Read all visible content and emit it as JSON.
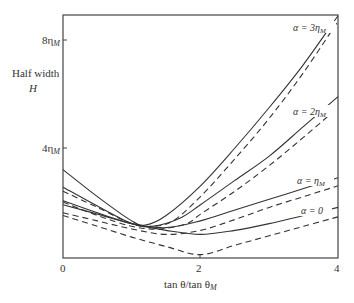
{
  "chart_data": {
    "type": "line",
    "title": "",
    "xlabel": "tan θ/tan θ_M",
    "ylabel": "Half width H",
    "xlim": [
      0,
      4
    ],
    "ylim": [
      0,
      8.9
    ],
    "x_ticks": [
      {
        "value": 0,
        "label": "0"
      },
      {
        "value": 2,
        "label": "2"
      },
      {
        "value": 4,
        "label": "4"
      }
    ],
    "y_ticks": [
      {
        "value": 4,
        "label": "4η_M"
      },
      {
        "value": 8,
        "label": "8η_M"
      }
    ],
    "grid": false,
    "legend": "inline labels near right edge",
    "series": [
      {
        "name": "α = 3η_M",
        "style": "solid",
        "points": [
          [
            0,
            3.2
          ],
          [
            0.5,
            2.2
          ],
          [
            1.0,
            1.3
          ],
          [
            1.2,
            1.15
          ],
          [
            1.5,
            1.5
          ],
          [
            2.0,
            2.6
          ],
          [
            2.5,
            4.0
          ],
          [
            3.0,
            5.5
          ],
          [
            3.5,
            7.1
          ],
          [
            4.0,
            8.9
          ]
        ]
      },
      {
        "name": "α = 3η_M (dashed)",
        "style": "dashed",
        "points": [
          [
            0,
            2.4
          ],
          [
            0.5,
            1.8
          ],
          [
            1.0,
            1.2
          ],
          [
            1.3,
            1.1
          ],
          [
            1.6,
            1.3
          ],
          [
            2.0,
            2.2
          ],
          [
            2.5,
            3.6
          ],
          [
            3.0,
            5.1
          ],
          [
            3.5,
            6.8
          ],
          [
            4.0,
            8.7
          ]
        ]
      },
      {
        "name": "α = 2η_M",
        "style": "solid",
        "points": [
          [
            0,
            2.55
          ],
          [
            0.5,
            1.85
          ],
          [
            1.0,
            1.2
          ],
          [
            1.3,
            1.1
          ],
          [
            1.7,
            1.4
          ],
          [
            2.0,
            1.9
          ],
          [
            2.5,
            2.8
          ],
          [
            3.0,
            3.7
          ],
          [
            3.5,
            4.8
          ],
          [
            4.0,
            5.9
          ]
        ]
      },
      {
        "name": "α = 2η_M (dashed)",
        "style": "dashed",
        "points": [
          [
            0,
            2.0
          ],
          [
            0.5,
            1.5
          ],
          [
            1.0,
            1.1
          ],
          [
            1.4,
            1.0
          ],
          [
            1.8,
            1.2
          ],
          [
            2.0,
            1.55
          ],
          [
            2.5,
            2.4
          ],
          [
            3.0,
            3.35
          ],
          [
            3.5,
            4.4
          ],
          [
            4.0,
            5.5
          ]
        ]
      },
      {
        "name": "α = η_M",
        "style": "solid",
        "points": [
          [
            0,
            2.05
          ],
          [
            0.5,
            1.6
          ],
          [
            1.0,
            1.2
          ],
          [
            1.5,
            1.05
          ],
          [
            2.0,
            1.3
          ],
          [
            2.5,
            1.7
          ],
          [
            3.0,
            2.1
          ],
          [
            3.5,
            2.5
          ],
          [
            4.0,
            2.9
          ]
        ]
      },
      {
        "name": "α = η_M (dashed)",
        "style": "dashed",
        "points": [
          [
            0,
            1.6
          ],
          [
            0.5,
            1.3
          ],
          [
            1.0,
            1.0
          ],
          [
            1.5,
            0.8
          ],
          [
            2.0,
            0.95
          ],
          [
            2.5,
            1.35
          ],
          [
            3.0,
            1.8
          ],
          [
            3.5,
            2.2
          ],
          [
            4.0,
            2.6
          ]
        ]
      },
      {
        "name": "α = 0",
        "style": "solid",
        "points": [
          [
            0,
            1.9
          ],
          [
            0.5,
            1.55
          ],
          [
            1.0,
            1.2
          ],
          [
            1.5,
            0.95
          ],
          [
            2.0,
            0.8
          ],
          [
            2.5,
            0.95
          ],
          [
            3.0,
            1.2
          ],
          [
            3.5,
            1.5
          ],
          [
            4.0,
            1.8
          ]
        ]
      },
      {
        "name": "α = 0 (dashed)",
        "style": "dashed",
        "points": [
          [
            0,
            1.5
          ],
          [
            0.5,
            1.1
          ],
          [
            1.0,
            0.7
          ],
          [
            1.5,
            0.35
          ],
          [
            2.0,
            0.05
          ],
          [
            2.5,
            0.4
          ],
          [
            3.0,
            0.75
          ],
          [
            3.5,
            1.1
          ],
          [
            4.0,
            1.45
          ]
        ]
      }
    ],
    "annotations": [
      {
        "text": "α = 3η_M",
        "x": 3.85,
        "y": 8.4
      },
      {
        "text": "α = 2η_M",
        "x": 3.85,
        "y": 5.3
      },
      {
        "text": "α = η_M",
        "x": 3.75,
        "y": 2.75
      },
      {
        "text": "α = 0",
        "x": 3.7,
        "y": 1.7
      }
    ]
  },
  "labels": {
    "ylabel_line1": "Half width",
    "ylabel_line2": "H",
    "xlabel": "tan θ/tan θ",
    "xlabel_sub": "M",
    "ytick_8": "8η",
    "ytick_4": "4η",
    "ytick_sub": "M",
    "xtick_0": "0",
    "xtick_2": "2",
    "xtick_4": "4",
    "ann_3": "α = 3η",
    "ann_2": "α = 2η",
    "ann_1": "α = η",
    "ann_0": "α = 0",
    "ann_sub": "M"
  }
}
